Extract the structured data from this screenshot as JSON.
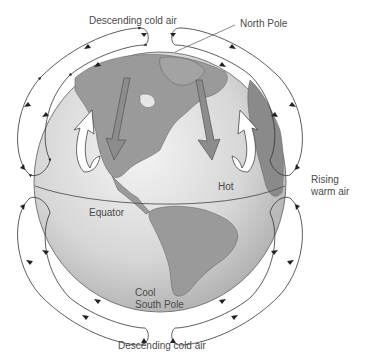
{
  "diagram": {
    "labels": {
      "top_descending": "Descending cold air",
      "north_pole": "North Pole",
      "rising_line1": "Rising",
      "rising_line2": "warm air",
      "hot": "Hot",
      "equator": "Equator",
      "cool": "Cool",
      "south_pole": "South Pole",
      "bottom_descending": "Descending cold air"
    },
    "colors": {
      "globe_ocean": "#d9d9d9",
      "globe_land": "#9a9a9a",
      "land_outline": "#6a6a6a",
      "arrow_down": "#8c8c8c",
      "arrow_up": "#ffffff",
      "loop_line": "#333333",
      "text": "#4a4a4a"
    }
  }
}
